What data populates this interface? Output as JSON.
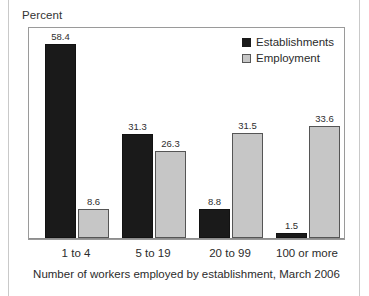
{
  "figure": {
    "y_axis_title": "Percent",
    "x_axis_caption": "Number of workers employed by establishment, March 2006"
  },
  "legend": {
    "items": [
      {
        "label": "Establishments",
        "swatch": "dark-square-swatch",
        "color": "#1a1a1a"
      },
      {
        "label": "Employment",
        "swatch": "light-square-swatch",
        "color": "#c6c6c6"
      }
    ]
  },
  "chart_data": {
    "type": "bar",
    "title": "",
    "subtitle": "",
    "xlabel": "Number of workers employed by establishment, March 2006",
    "ylabel": "Percent",
    "categories": [
      "1 to 4",
      "5 to 19",
      "20 to 99",
      "100 or more"
    ],
    "series": [
      {
        "name": "Establishments",
        "color": "#1a1a1a",
        "values": [
          58.4,
          31.3,
          8.8,
          1.5
        ]
      },
      {
        "name": "Employment",
        "color": "#c6c6c6",
        "values": [
          8.6,
          26.3,
          31.5,
          33.6
        ]
      }
    ],
    "ylim": [
      0,
      62
    ],
    "grid": false,
    "y_ticks_visible": false,
    "data_labels": true,
    "legend_position": "top-right"
  }
}
